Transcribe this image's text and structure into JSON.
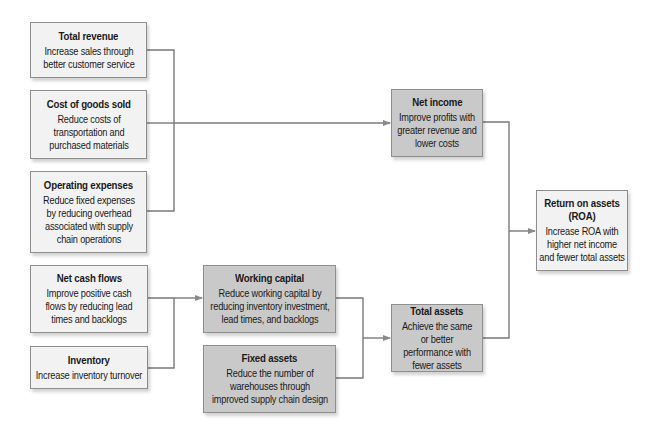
{
  "colors": {
    "light_box": "#f2f2f2",
    "dark_box": "#c9c9c9",
    "border": "#8e8e8e",
    "connector": "#7a7a7a"
  },
  "nodes": {
    "total_revenue": {
      "title": "Total revenue",
      "desc": "Increase sales through better customer service"
    },
    "cost_of_goods_sold": {
      "title": "Cost of goods sold",
      "desc": "Reduce costs of transportation and purchased materials"
    },
    "operating_expenses": {
      "title": "Operating expenses",
      "desc": "Reduce fixed expenses by reducing overhead associated with supply chain operations"
    },
    "net_cash_flows": {
      "title": "Net cash flows",
      "desc": "Improve positive cash flows by reducing lead times and backlogs"
    },
    "inventory": {
      "title": "Inventory",
      "desc": "Increase inventory turnover"
    },
    "net_income": {
      "title": "Net income",
      "desc": "Improve profits with greater revenue and lower costs"
    },
    "working_capital": {
      "title": "Working capital",
      "desc": "Reduce working capital by reducing inventory investment, lead times, and backlogs"
    },
    "fixed_assets": {
      "title": "Fixed assets",
      "desc": "Reduce the number of warehouses through improved supply chain design"
    },
    "total_assets": {
      "title": "Total assets",
      "desc": "Achieve the same or better performance with fewer assets"
    },
    "roa": {
      "title": "Return on assets (ROA)",
      "desc": "Increase ROA with higher net income and fewer total assets"
    }
  },
  "edges": [
    {
      "from": [
        "total_revenue",
        "cost_of_goods_sold",
        "operating_expenses"
      ],
      "to": "net_income"
    },
    {
      "from": [
        "net_cash_flows",
        "inventory"
      ],
      "to": "working_capital"
    },
    {
      "from": [
        "working_capital",
        "fixed_assets"
      ],
      "to": "total_assets"
    },
    {
      "from": [
        "net_income",
        "total_assets"
      ],
      "to": "roa"
    }
  ]
}
